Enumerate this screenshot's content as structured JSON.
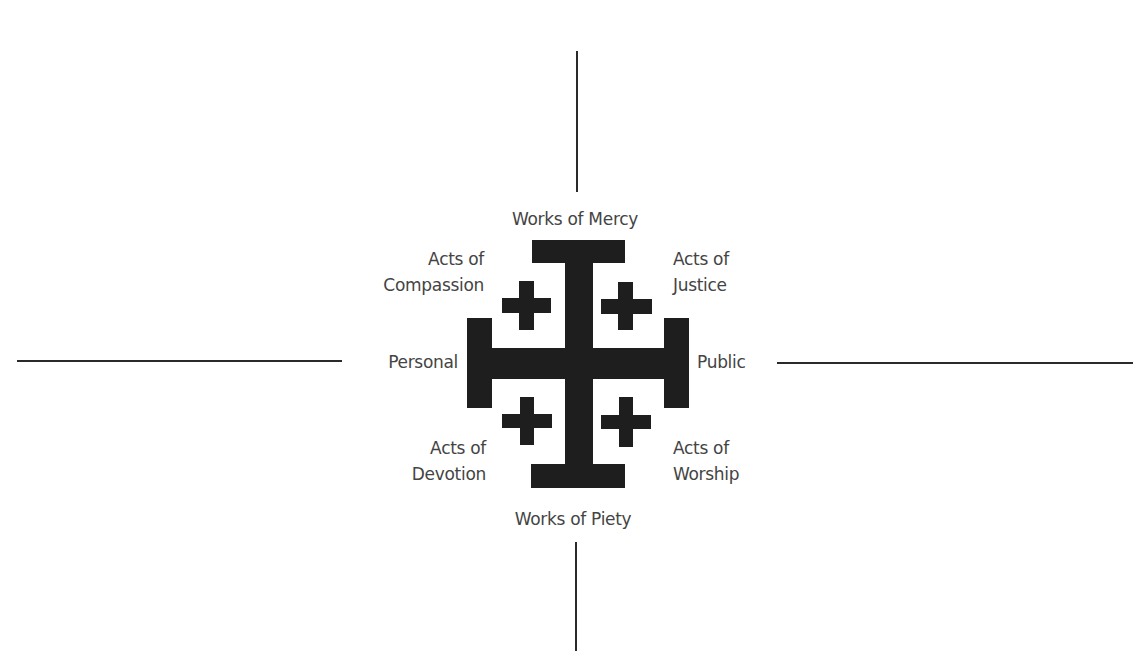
{
  "diagram": {
    "title_cutoff": "",
    "colors": {
      "cross": "#1e1e1e",
      "axis": "#2a2a2a",
      "text": "#444444",
      "background": "#ffffff"
    },
    "icon": "jerusalem-cross-icon",
    "axes": {
      "top": "Works of Mercy",
      "bottom": "Works of Piety",
      "left": "Personal",
      "right": "Public"
    },
    "quadrants": {
      "top_left": {
        "line1": "Acts of",
        "line2": "Compassion"
      },
      "top_right": {
        "line1": "Acts of",
        "line2": "Justice"
      },
      "bottom_left": {
        "line1": "Acts of",
        "line2": "Devotion"
      },
      "bottom_right": {
        "line1": "Acts of",
        "line2": "Worship"
      }
    }
  }
}
